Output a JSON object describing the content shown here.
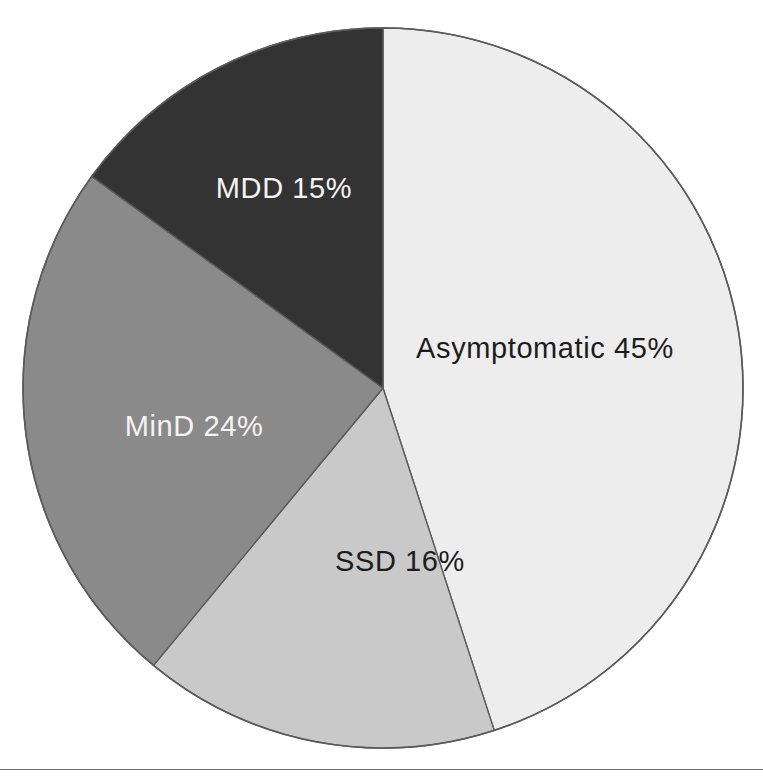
{
  "figure": {
    "name": "depression-severity-distribution-pie",
    "background_color": "#ffffff",
    "has_bottom_rule": true,
    "rule_color": "#6e6e6e"
  },
  "chart_data": {
    "type": "pie",
    "title": "",
    "subtitle": "",
    "xlabel": "",
    "ylabel": "",
    "legend_position": "none",
    "grid": false,
    "labels_inside_slices": true,
    "start_angle_deg": 0,
    "direction": "clockwise",
    "categories": [
      "Asymptomatic",
      "SSD",
      "MinD",
      "MDD"
    ],
    "values": [
      45,
      16,
      24,
      15
    ],
    "units": "%",
    "colors": [
      "#ededed",
      "#c9c9c9",
      "#8a8a8a",
      "#333333"
    ],
    "slices": [
      {
        "name": "Asymptomatic",
        "value": 45,
        "label": "Asymptomatic 45%",
        "color": "#ededed",
        "text_color": "#1c1c1c",
        "label_x": 545,
        "label_y": 350
      },
      {
        "name": "SSD",
        "value": 16,
        "label": "SSD 16%",
        "color": "#c9c9c9",
        "text_color": "#1c1c1c",
        "label_x": 400,
        "label_y": 563
      },
      {
        "name": "MinD",
        "value": 24,
        "label": "MinD 24%",
        "color": "#8a8a8a",
        "text_color": "#f4f4f4",
        "label_x": 194,
        "label_y": 428
      },
      {
        "name": "MDD",
        "value": 15,
        "label": "MDD 15%",
        "color": "#333333",
        "text_color": "#f4f4f4",
        "label_x": 284,
        "label_y": 190
      }
    ],
    "geometry": {
      "center_x": 383,
      "center_y": 388,
      "radius": 360
    }
  }
}
